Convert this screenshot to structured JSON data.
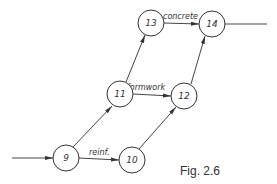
{
  "caption": "Fig. 2.6",
  "nodes": [
    {
      "id": "9",
      "label": "9",
      "x": 66,
      "y": 158
    },
    {
      "id": "10",
      "label": "10",
      "x": 132,
      "y": 160
    },
    {
      "id": "11",
      "label": "11",
      "x": 120,
      "y": 94
    },
    {
      "id": "12",
      "label": "12",
      "x": 184,
      "y": 96
    },
    {
      "id": "13",
      "label": "13",
      "x": 151,
      "y": 23
    },
    {
      "id": "14",
      "label": "14",
      "x": 212,
      "y": 24
    }
  ],
  "edges": [
    {
      "from": "in",
      "to": "9",
      "label": ""
    },
    {
      "from": "9",
      "to": "10",
      "label": "reinf."
    },
    {
      "from": "9",
      "to": "11",
      "label": ""
    },
    {
      "from": "10",
      "to": "12",
      "label": ""
    },
    {
      "from": "11",
      "to": "12",
      "label": "formwork"
    },
    {
      "from": "11",
      "to": "13",
      "label": ""
    },
    {
      "from": "12",
      "to": "14",
      "label": ""
    },
    {
      "from": "13",
      "to": "14",
      "label": "concrete"
    },
    {
      "from": "14",
      "to": "out",
      "label": ""
    }
  ],
  "labels": {
    "reinf": "reinf.",
    "formwork": "formwork",
    "concrete": "concrete"
  }
}
